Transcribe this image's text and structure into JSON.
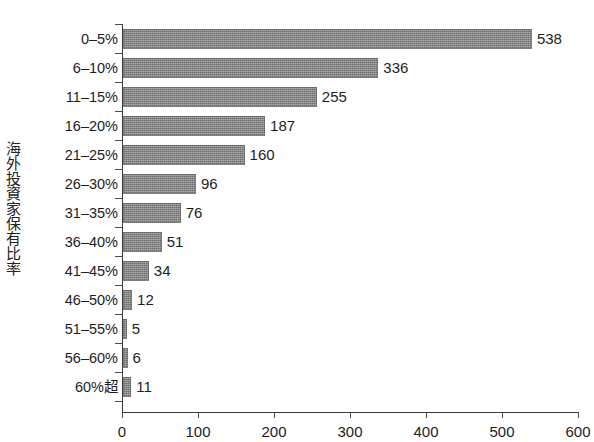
{
  "chart_data": {
    "type": "bar",
    "orientation": "horizontal",
    "title": "",
    "xlabel": "",
    "ylabel": "海外投資家保有比率",
    "xlim": [
      0,
      600
    ],
    "xticks": [
      0,
      100,
      200,
      300,
      400,
      500,
      600
    ],
    "xtick_labels": [
      "0",
      "100",
      "200",
      "300",
      "400",
      "500",
      "600"
    ],
    "grid": false,
    "legend": false,
    "bar_color": "#8d8d8d",
    "axis_color": "#3a3a3a",
    "categories": [
      "0–5%",
      "6–10%",
      "11–15%",
      "16–20%",
      "21–25%",
      "26–30%",
      "31–35%",
      "36–40%",
      "41–45%",
      "46–50%",
      "51–55%",
      "56–60%",
      "60%超"
    ],
    "values": [
      538,
      336,
      255,
      187,
      160,
      96,
      76,
      51,
      34,
      12,
      5,
      6,
      11
    ],
    "value_labels": [
      "538",
      "336",
      "255",
      "187",
      "160",
      "96",
      "76",
      "51",
      "34",
      "12",
      "5",
      "6",
      "11"
    ]
  }
}
